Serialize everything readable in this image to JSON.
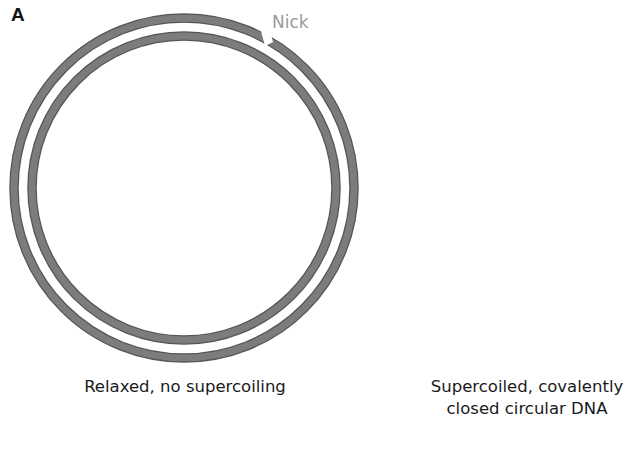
{
  "figure": {
    "panel_label": "A",
    "relaxed": {
      "annotation": "Nick",
      "caption": "Relaxed, no supercoiling"
    },
    "supercoiled": {
      "caption_line1": "Supercoiled, covalently",
      "caption_line2": "closed circular DNA"
    },
    "colors": {
      "strand_fill": "#7c7c7c",
      "strand_edge": "#555555",
      "nick_text": "#9a9a9a",
      "text": "#1a1a1a"
    }
  }
}
